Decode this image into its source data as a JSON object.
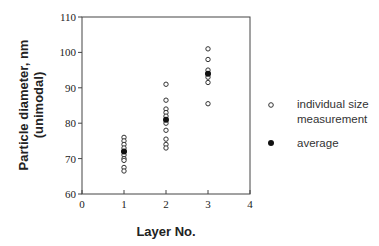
{
  "chart_data": {
    "type": "scatter",
    "title": "",
    "xlabel": "Layer No.",
    "ylabel_line1": "Particle diameter, nm",
    "ylabel_line2": "(unimodal)",
    "xlim": [
      0,
      4
    ],
    "ylim": [
      60,
      110
    ],
    "xticks": [
      0,
      1,
      2,
      3,
      4
    ],
    "yticks": [
      60,
      70,
      80,
      90,
      100,
      110
    ],
    "grid": false,
    "legend_position": "right",
    "series": [
      {
        "name": "individual size measurement",
        "marker": "open-circle",
        "points": [
          {
            "x": 1,
            "y": 76
          },
          {
            "x": 1,
            "y": 75
          },
          {
            "x": 1,
            "y": 74
          },
          {
            "x": 1,
            "y": 73
          },
          {
            "x": 1,
            "y": 72
          },
          {
            "x": 1,
            "y": 71
          },
          {
            "x": 1,
            "y": 70
          },
          {
            "x": 1,
            "y": 69.5
          },
          {
            "x": 1,
            "y": 67.5
          },
          {
            "x": 1,
            "y": 66.5
          },
          {
            "x": 2,
            "y": 91
          },
          {
            "x": 2,
            "y": 86.5
          },
          {
            "x": 2,
            "y": 84
          },
          {
            "x": 2,
            "y": 83
          },
          {
            "x": 2,
            "y": 82
          },
          {
            "x": 2,
            "y": 80
          },
          {
            "x": 2,
            "y": 78
          },
          {
            "x": 2,
            "y": 75.5
          },
          {
            "x": 2,
            "y": 74
          },
          {
            "x": 2,
            "y": 73
          },
          {
            "x": 3,
            "y": 101
          },
          {
            "x": 3,
            "y": 98
          },
          {
            "x": 3,
            "y": 95
          },
          {
            "x": 3,
            "y": 94
          },
          {
            "x": 3,
            "y": 93
          },
          {
            "x": 3,
            "y": 91.5
          },
          {
            "x": 3,
            "y": 85.5
          }
        ]
      },
      {
        "name": "average",
        "marker": "filled-circle",
        "points": [
          {
            "x": 1,
            "y": 72
          },
          {
            "x": 2,
            "y": 81
          },
          {
            "x": 3,
            "y": 94
          }
        ]
      }
    ]
  },
  "legend": {
    "open_line1": "individual size",
    "open_line2": "measurement",
    "filled": "average"
  }
}
